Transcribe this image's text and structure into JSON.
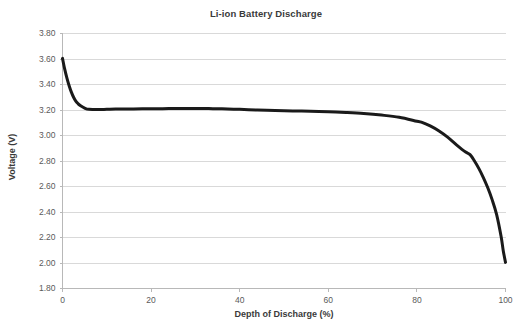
{
  "chart_data": {
    "type": "line",
    "title": "Li-ion Battery Discharge",
    "xlabel": "Depth of Discharge (%)",
    "ylabel": "Voltage (V)",
    "xlim": [
      0,
      100
    ],
    "ylim": [
      1.8,
      3.8
    ],
    "xticks": [
      0,
      20,
      40,
      60,
      80,
      100
    ],
    "xtick_labels": [
      "0",
      "20",
      "40",
      "60",
      "80",
      "100"
    ],
    "yticks": [
      1.8,
      2.0,
      2.2,
      2.4,
      2.6,
      2.8,
      3.0,
      3.2,
      3.4,
      3.6,
      3.8
    ],
    "ytick_labels": [
      "1.80",
      "2.00",
      "2.20",
      "2.40",
      "2.60",
      "2.80",
      "3.00",
      "3.20",
      "3.40",
      "3.60",
      "3.80"
    ],
    "grid": "horizontal",
    "grid_color": "#d9d9d9",
    "legend": false,
    "legend_position": "none",
    "series": [
      {
        "name": "Discharge curve",
        "color": "#1a1a1a",
        "line_width": 3,
        "x": [
          0,
          0.5,
          1,
          1.5,
          2,
          2.5,
          3,
          3.5,
          4,
          5,
          6,
          8,
          10,
          12,
          15,
          18,
          20,
          24,
          28,
          30,
          33,
          36,
          40,
          44,
          48,
          52,
          56,
          60,
          64,
          68,
          72,
          76,
          80,
          81,
          83,
          85,
          87,
          89,
          91,
          92,
          93,
          94,
          95,
          96,
          97,
          98,
          99,
          99.5,
          100
        ],
        "y": [
          3.605,
          3.52,
          3.45,
          3.39,
          3.34,
          3.3,
          3.27,
          3.25,
          3.235,
          3.215,
          3.205,
          3.203,
          3.205,
          3.207,
          3.208,
          3.209,
          3.21,
          3.211,
          3.212,
          3.212,
          3.211,
          3.209,
          3.205,
          3.2,
          3.196,
          3.193,
          3.19,
          3.186,
          3.18,
          3.172,
          3.16,
          3.143,
          3.112,
          3.105,
          3.075,
          3.035,
          2.985,
          2.925,
          2.87,
          2.85,
          2.8,
          2.74,
          2.67,
          2.59,
          2.495,
          2.38,
          2.21,
          2.095,
          2.005
        ]
      }
    ]
  }
}
